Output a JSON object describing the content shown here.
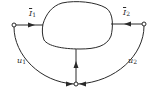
{
  "diagram": {
    "type": "two-port network",
    "colors": {
      "stroke": "#2a2a2a",
      "background": "#ffffff"
    },
    "labels": {
      "current_1": {
        "symbol": "I",
        "subscript": "1"
      },
      "current_2": {
        "symbol": "I",
        "subscript": "2"
      },
      "voltage_1": {
        "symbol": "u",
        "subscript": "1"
      },
      "voltage_2": {
        "symbol": "u",
        "subscript": "2"
      }
    },
    "nodes": [
      {
        "id": "terminal-1",
        "x": 14,
        "y": 25
      },
      {
        "id": "terminal-2",
        "x": 144,
        "y": 24
      },
      {
        "id": "common-node",
        "x": 76,
        "y": 84
      }
    ]
  }
}
